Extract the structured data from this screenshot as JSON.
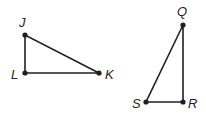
{
  "figures": [
    {
      "name": "triangle-JLK",
      "vertices": [
        {
          "label": "J",
          "x": 25,
          "y": 35,
          "lx": 19,
          "ly": 27
        },
        {
          "label": "L",
          "x": 25,
          "y": 73,
          "lx": 11,
          "ly": 79
        },
        {
          "label": "K",
          "x": 99,
          "y": 73,
          "lx": 105,
          "ly": 79
        }
      ]
    },
    {
      "name": "triangle-QRS",
      "vertices": [
        {
          "label": "Q",
          "x": 183,
          "y": 25,
          "lx": 177,
          "ly": 16
        },
        {
          "label": "R",
          "x": 183,
          "y": 102,
          "lx": 188,
          "ly": 108
        },
        {
          "label": "S",
          "x": 146,
          "y": 102,
          "lx": 132,
          "ly": 108
        }
      ]
    }
  ],
  "colors": {
    "stroke": "#231f20",
    "background": "#ffffff"
  }
}
